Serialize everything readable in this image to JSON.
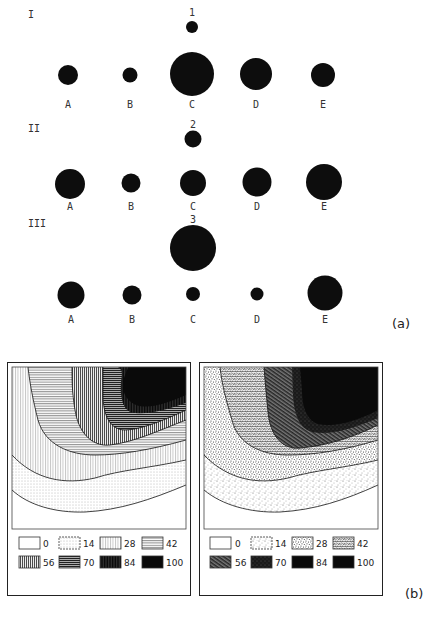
{
  "part_a": {
    "label": "(a)",
    "rows": [
      {
        "roman": "I",
        "top": {
          "label": "1",
          "cx": 192,
          "cy": 27,
          "r": 6
        },
        "circles": [
          {
            "label": "A",
            "cx": 68,
            "cy": 75,
            "r": 10
          },
          {
            "label": "B",
            "cx": 130,
            "cy": 75,
            "r": 7.5
          },
          {
            "label": "C",
            "cx": 192,
            "cy": 74,
            "r": 22
          },
          {
            "label": "D",
            "cx": 256,
            "cy": 74,
            "r": 16
          },
          {
            "label": "E",
            "cx": 323,
            "cy": 75,
            "r": 12
          }
        ],
        "label_y": 108,
        "roman_y": 18,
        "top_label_y": 16
      },
      {
        "roman": "II",
        "top": {
          "label": "2",
          "cx": 193,
          "cy": 139,
          "r": 8.5
        },
        "circles": [
          {
            "label": "A",
            "cx": 70,
            "cy": 184,
            "r": 15
          },
          {
            "label": "B",
            "cx": 131,
            "cy": 183,
            "r": 9.5
          },
          {
            "label": "C",
            "cx": 193,
            "cy": 183,
            "r": 13
          },
          {
            "label": "D",
            "cx": 257,
            "cy": 182,
            "r": 14.5
          },
          {
            "label": "E",
            "cx": 324,
            "cy": 182,
            "r": 18
          }
        ],
        "label_y": 210,
        "roman_y": 132,
        "top_label_y": 128
      },
      {
        "roman": "III",
        "top": {
          "label": "3",
          "cx": 193,
          "cy": 248,
          "r": 23
        },
        "circles": [
          {
            "label": "A",
            "cx": 71,
            "cy": 295,
            "r": 13.5
          },
          {
            "label": "B",
            "cx": 132,
            "cy": 295,
            "r": 9.5
          },
          {
            "label": "C",
            "cx": 193,
            "cy": 294,
            "r": 7
          },
          {
            "label": "D",
            "cx": 257,
            "cy": 294,
            "r": 6.5
          },
          {
            "label": "E",
            "cx": 325,
            "cy": 293,
            "r": 17.5
          }
        ],
        "label_y": 323,
        "roman_y": 227,
        "top_label_y": 223
      }
    ]
  },
  "part_b": {
    "label": "(b)",
    "panels": [
      {
        "name": "left-contour-map",
        "legend": [
          "0",
          "14",
          "28",
          "42",
          "56",
          "70",
          "84",
          "100"
        ]
      },
      {
        "name": "right-contour-map",
        "legend": [
          "0",
          "14",
          "28",
          "42",
          "56",
          "70",
          "84",
          "100"
        ]
      }
    ]
  },
  "colors": {
    "ink": "#0d0d0d",
    "text": "#333333",
    "background": "#ffffff"
  }
}
